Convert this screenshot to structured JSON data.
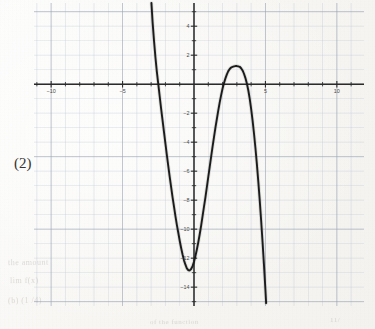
{
  "problem": {
    "number_label": "(2)"
  },
  "ghost_text": [
    {
      "text": "the amount",
      "x": 8,
      "y": 258,
      "size": 8,
      "rotate": -0.6
    },
    {
      "text": "lim f(x)",
      "x": 10,
      "y": 276,
      "size": 8,
      "rotate": -0.6
    },
    {
      "text": "(b) (1 /4)",
      "x": 8,
      "y": 296,
      "size": 8,
      "rotate": -0.6
    },
    {
      "text": "of the function",
      "x": 150,
      "y": 318,
      "size": 7,
      "rotate": -0.4
    },
    {
      "text": "11/",
      "x": 330,
      "y": 316,
      "size": 7,
      "rotate": -0.4
    }
  ],
  "colors": {
    "grid_minor": "#b9c2cf",
    "grid_major": "#9aa5b5",
    "axis": "#2b2b2b",
    "curve": "#1b1b1b",
    "tick_text": "#4a4843",
    "paper": "#f8f7f4"
  },
  "chart_data": {
    "type": "line",
    "title": "",
    "subtitle": "",
    "xlabel": "",
    "ylabel": "",
    "xlim": [
      -11.2,
      11.9
    ],
    "ylim": [
      -15.3,
      5.6
    ],
    "xticks": [
      -10,
      -5,
      5,
      10
    ],
    "xtick_labels": [
      "−10",
      "−5",
      "5",
      "10"
    ],
    "yticks": [
      4,
      2,
      -2,
      -4,
      -6,
      -8,
      -10,
      -12,
      -14
    ],
    "ytick_labels": [
      "4",
      "2",
      "−2",
      "−4",
      "−6",
      "−8",
      "−10",
      "−12",
      "−14"
    ],
    "xtick_minor_step": 1,
    "ytick_minor_step": 1,
    "grid": true,
    "grid_style": "graph-paper",
    "legend": "none",
    "axis_arrows": false,
    "series": [
      {
        "name": "polynomial",
        "description": "cubic-like curve with local minimum near (-0.35, -12.85) and local maximum near (3.2, 1.2)",
        "x_intercepts": [
          -2.5,
          2.45,
          4.2
        ],
        "local_minimum": [
          -0.35,
          -12.85
        ],
        "local_maximum": [
          3.2,
          1.2
        ],
        "y_intercept": -12.6,
        "points": [
          [
            -2.98,
            5.6
          ],
          [
            -2.9,
            4.3
          ],
          [
            -2.8,
            3.0
          ],
          [
            -2.7,
            1.85
          ],
          [
            -2.6,
            0.85
          ],
          [
            -2.5,
            0.0
          ],
          [
            -2.4,
            -0.85
          ],
          [
            -2.3,
            -1.7
          ],
          [
            -2.2,
            -2.5
          ],
          [
            -2.1,
            -3.3
          ],
          [
            -2.0,
            -4.1
          ],
          [
            -1.9,
            -4.9
          ],
          [
            -1.8,
            -5.65
          ],
          [
            -1.7,
            -6.4
          ],
          [
            -1.6,
            -7.1
          ],
          [
            -1.5,
            -7.8
          ],
          [
            -1.4,
            -8.45
          ],
          [
            -1.3,
            -9.1
          ],
          [
            -1.2,
            -9.7
          ],
          [
            -1.1,
            -10.25
          ],
          [
            -1.0,
            -10.8
          ],
          [
            -0.9,
            -11.3
          ],
          [
            -0.8,
            -11.75
          ],
          [
            -0.7,
            -12.15
          ],
          [
            -0.6,
            -12.45
          ],
          [
            -0.5,
            -12.7
          ],
          [
            -0.4,
            -12.83
          ],
          [
            -0.35,
            -12.85
          ],
          [
            -0.3,
            -12.84
          ],
          [
            -0.2,
            -12.75
          ],
          [
            -0.1,
            -12.55
          ],
          [
            0.0,
            -12.25
          ],
          [
            0.1,
            -11.85
          ],
          [
            0.2,
            -11.4
          ],
          [
            0.3,
            -10.9
          ],
          [
            0.4,
            -10.35
          ],
          [
            0.5,
            -9.75
          ],
          [
            0.6,
            -9.1
          ],
          [
            0.7,
            -8.45
          ],
          [
            0.8,
            -7.8
          ],
          [
            0.9,
            -7.1
          ],
          [
            1.0,
            -6.4
          ],
          [
            1.1,
            -5.7
          ],
          [
            1.2,
            -5.0
          ],
          [
            1.3,
            -4.3
          ],
          [
            1.4,
            -3.65
          ],
          [
            1.5,
            -3.0
          ],
          [
            1.6,
            -2.4
          ],
          [
            1.7,
            -1.8
          ],
          [
            1.8,
            -1.25
          ],
          [
            1.9,
            -0.75
          ],
          [
            2.0,
            -0.3
          ],
          [
            2.1,
            0.08
          ],
          [
            2.2,
            0.4
          ],
          [
            2.3,
            0.68
          ],
          [
            2.4,
            0.9
          ],
          [
            2.5,
            1.05
          ],
          [
            2.6,
            1.15
          ],
          [
            2.7,
            1.2
          ],
          [
            2.8,
            1.23
          ],
          [
            2.9,
            1.25
          ],
          [
            3.0,
            1.25
          ],
          [
            3.1,
            1.23
          ],
          [
            3.2,
            1.2
          ],
          [
            3.3,
            1.1
          ],
          [
            3.4,
            0.95
          ],
          [
            3.5,
            0.72
          ],
          [
            3.6,
            0.42
          ],
          [
            3.7,
            0.05
          ],
          [
            3.8,
            -0.42
          ],
          [
            3.9,
            -1.0
          ],
          [
            4.0,
            -1.7
          ],
          [
            4.1,
            -2.5
          ],
          [
            4.2,
            -3.4
          ],
          [
            4.3,
            -4.4
          ],
          [
            4.4,
            -5.5
          ],
          [
            4.5,
            -6.7
          ],
          [
            4.6,
            -8.0
          ],
          [
            4.7,
            -9.4
          ],
          [
            4.8,
            -10.9
          ],
          [
            4.9,
            -12.5
          ],
          [
            5.0,
            -14.2
          ],
          [
            5.05,
            -15.1
          ]
        ]
      }
    ]
  }
}
